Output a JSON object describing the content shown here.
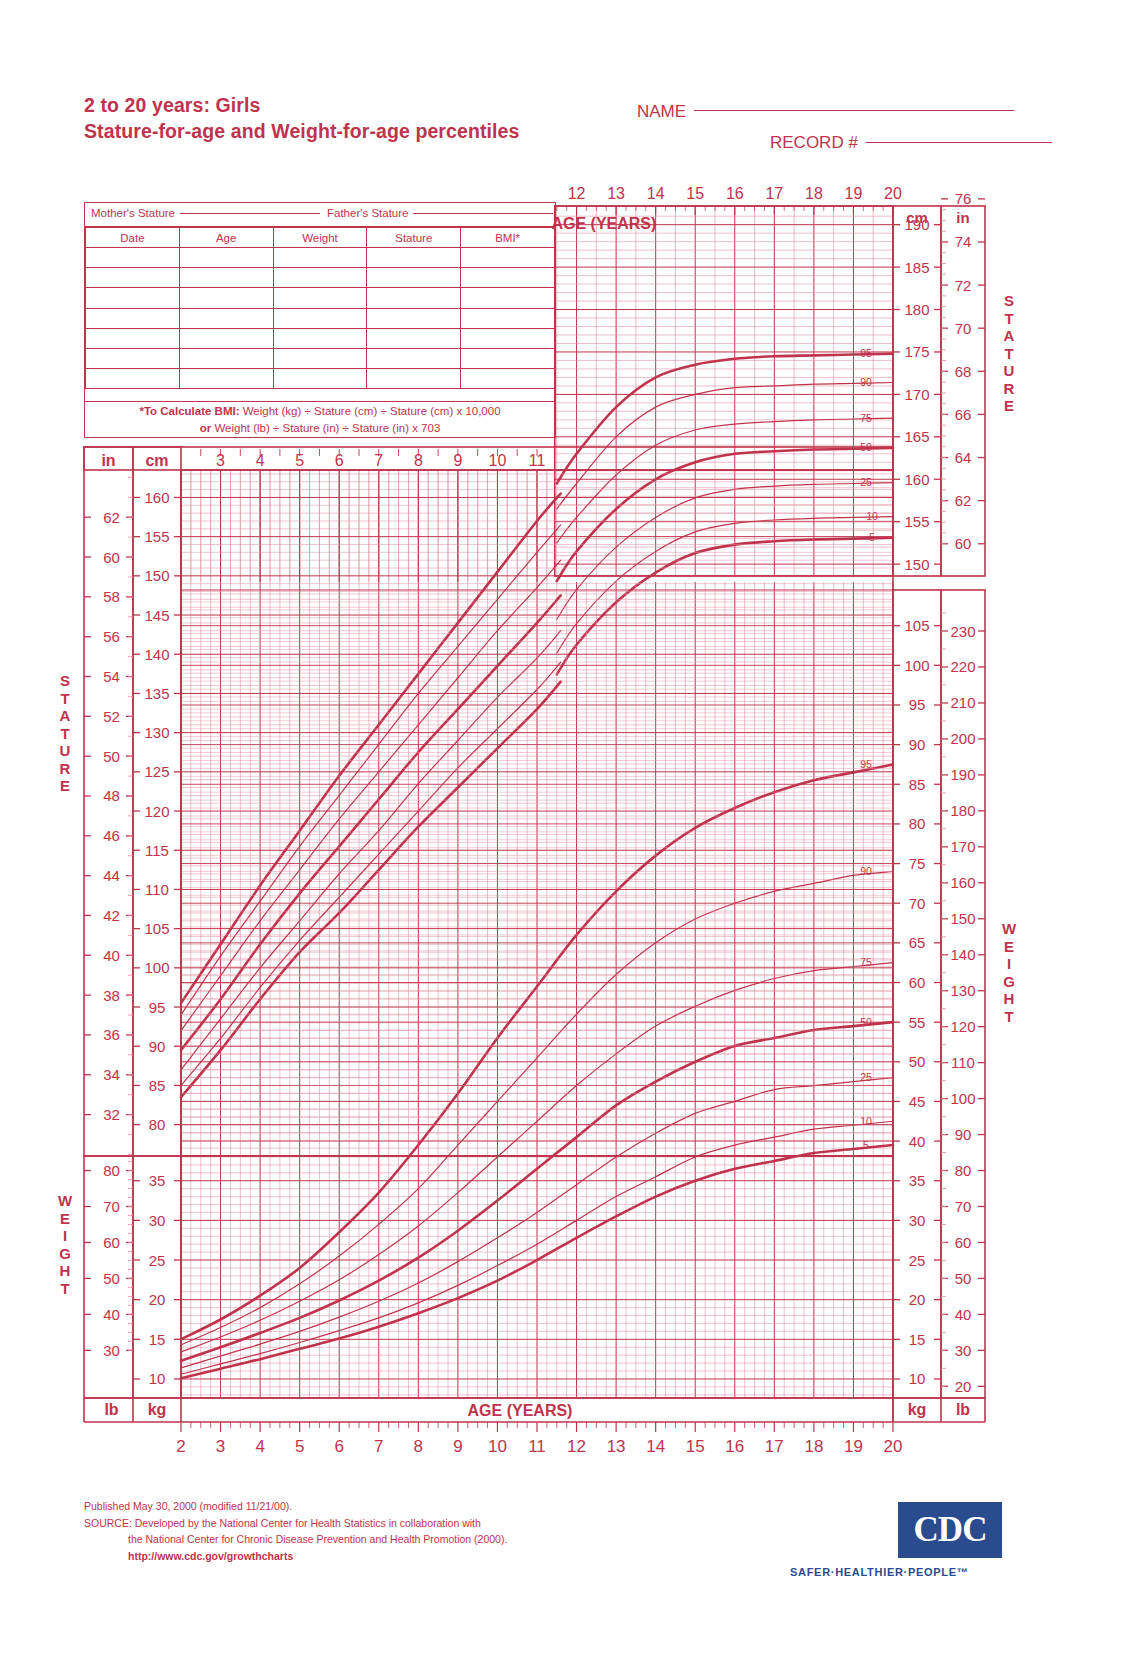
{
  "header": {
    "title_line1": "2 to 20 years: Girls",
    "title_line2": "Stature-for-age and Weight-for-age percentiles",
    "name_label": "NAME",
    "record_label": "RECORD #"
  },
  "table": {
    "mother_label": "Mother's Stature",
    "father_label": "Father's Stature",
    "columns": [
      "Date",
      "Age",
      "Weight",
      "Stature",
      "BMI*"
    ],
    "rows": [
      [
        "",
        "",
        "",
        "",
        ""
      ],
      [
        "",
        "",
        "",
        "",
        ""
      ],
      [
        "",
        "",
        "",
        "",
        ""
      ],
      [
        "",
        "",
        "",
        "",
        ""
      ],
      [
        "",
        "",
        "",
        "",
        ""
      ],
      [
        "",
        "",
        "",
        "",
        ""
      ],
      [
        "",
        "",
        "",
        "",
        ""
      ]
    ],
    "bmi_note_prefix": "*To Calculate BMI:",
    "bmi_note_line1": " Weight (kg) ÷ Stature (cm) ÷ Stature (cm) x 10,000",
    "bmi_note_or": "or",
    "bmi_note_line2": " Weight (lb) ÷ Stature (in) ÷ Stature (in) x 703"
  },
  "labels": {
    "age_years_top": "AGE (YEARS)",
    "age_years_bottom": "AGE (YEARS)",
    "stature_word": "STATURE",
    "weight_word": "WEIGHT",
    "cm": "cm",
    "in": "in",
    "kg": "kg",
    "lb": "lb"
  },
  "footer": {
    "published": "Published May 30, 2000 (modified 11/21/00).",
    "source1": "SOURCE: Developed by the National Center for Health Statistics in collaboration with",
    "source2": "the National Center for Chronic Disease Prevention and Health Promotion (2000).",
    "url": "http://www.cdc.gov/growthcharts",
    "cdc_logo": "CDC",
    "cdc_tagline": "SAFER·HEALTHIER·PEOPLE™"
  },
  "colors": {
    "chart_red": "#c0334d",
    "grid_light": "#e08a9b",
    "cdc_blue": "#2a4b8d"
  },
  "chart_data": {
    "type": "line",
    "xlabel": "AGE (YEARS)",
    "xlim": [
      2,
      20
    ],
    "x_ticks_bottom": [
      2,
      3,
      4,
      5,
      6,
      7,
      8,
      9,
      10,
      11,
      12,
      13,
      14,
      15,
      16,
      17,
      18,
      19,
      20
    ],
    "x_ticks_top_upper": [
      12,
      13,
      14,
      15,
      16,
      17,
      18,
      19,
      20
    ],
    "x_ticks_mid": [
      3,
      4,
      5,
      6,
      7,
      8,
      9,
      10,
      11
    ],
    "panels": [
      {
        "name": "stature-upper-right",
        "ylabel": "STATURE",
        "y_unit_left": "cm",
        "y_unit_right": "in",
        "ylim_cm": [
          150,
          192
        ],
        "y_ticks_cm": [
          150,
          155,
          160,
          165,
          170,
          175,
          180,
          185,
          190
        ],
        "y_ticks_in": [
          60,
          62,
          64,
          66,
          68,
          70,
          72,
          74,
          76
        ],
        "xlim": [
          11.5,
          20
        ],
        "percentile_labels": [
          "95",
          "90",
          "75",
          "50",
          "25",
          "10",
          "5"
        ]
      },
      {
        "name": "stature-main",
        "ylabel": "STATURE",
        "y_unit_left": "in",
        "y_unit_right": "cm",
        "ylim_cm": [
          76,
          163
        ],
        "y_ticks_in": [
          30,
          32,
          34,
          36,
          38,
          40,
          42,
          44,
          46,
          48,
          50,
          52,
          54,
          56,
          58,
          60,
          62
        ],
        "y_ticks_cm": [
          80,
          85,
          90,
          95,
          100,
          105,
          110,
          115,
          120,
          125,
          130,
          135,
          140,
          145,
          150,
          155,
          160
        ],
        "xlim": [
          2,
          11.6
        ],
        "percentile_labels": [
          "95",
          "90",
          "75",
          "50",
          "25",
          "10",
          "5"
        ],
        "series": [
          {
            "name": "95th",
            "unit": "cm",
            "x": [
              2,
              3,
              4,
              5,
              6,
              7,
              8,
              9,
              10,
              11,
              11.6
            ],
            "y": [
              95.5,
              103.0,
              110.5,
              117.5,
              124.5,
              131.0,
              137.5,
              144.0,
              150.5,
              157.0,
              160.5
            ]
          },
          {
            "name": "90th",
            "unit": "cm",
            "x": [
              2,
              3,
              4,
              5,
              6,
              7,
              8,
              9,
              10,
              11,
              11.6
            ],
            "y": [
              94.0,
              101.5,
              108.5,
              115.5,
              122.0,
              128.5,
              135.0,
              141.0,
              147.0,
              153.0,
              156.5
            ]
          },
          {
            "name": "75th",
            "unit": "cm",
            "x": [
              2,
              3,
              4,
              5,
              6,
              7,
              8,
              9,
              10,
              11,
              11.6
            ],
            "y": [
              92.0,
              99.0,
              106.0,
              112.5,
              119.0,
              125.0,
              131.0,
              137.0,
              143.0,
              148.5,
              152.0
            ]
          },
          {
            "name": "50th",
            "unit": "cm",
            "x": [
              2,
              3,
              4,
              5,
              6,
              7,
              8,
              9,
              10,
              11,
              11.6
            ],
            "y": [
              89.5,
              96.0,
              103.0,
              109.5,
              115.5,
              121.5,
              127.5,
              133.0,
              138.5,
              144.0,
              147.5
            ]
          },
          {
            "name": "25th",
            "unit": "cm",
            "x": [
              2,
              3,
              4,
              5,
              6,
              7,
              8,
              9,
              10,
              11,
              11.6
            ],
            "y": [
              87.0,
              93.5,
              100.0,
              106.0,
              112.0,
              117.5,
              123.5,
              129.0,
              134.5,
              139.5,
              143.0
            ]
          },
          {
            "name": "10th",
            "unit": "cm",
            "x": [
              2,
              3,
              4,
              5,
              6,
              7,
              8,
              9,
              10,
              11,
              11.6
            ],
            "y": [
              85.0,
              91.0,
              97.5,
              103.5,
              109.0,
              114.5,
              120.0,
              125.5,
              130.5,
              135.5,
              139.0
            ]
          },
          {
            "name": "5th",
            "unit": "cm",
            "x": [
              2,
              3,
              4,
              5,
              6,
              7,
              8,
              9,
              10,
              11,
              11.6
            ],
            "y": [
              83.5,
              89.5,
              96.0,
              102.0,
              107.0,
              112.5,
              118.0,
              123.0,
              128.0,
              133.0,
              136.5
            ]
          }
        ]
      },
      {
        "name": "weight-right",
        "ylabel": "WEIGHT",
        "y_unit_left": "kg",
        "y_unit_right": "lb",
        "ylim_kg": [
          8,
          108
        ],
        "y_ticks_kg": [
          10,
          15,
          20,
          25,
          30,
          35,
          40,
          45,
          50,
          55,
          60,
          65,
          70,
          75,
          80,
          85,
          90,
          95,
          100,
          105
        ],
        "y_ticks_lb": [
          20,
          30,
          40,
          50,
          60,
          70,
          80,
          90,
          100,
          110,
          120,
          130,
          140,
          150,
          160,
          170,
          180,
          190,
          200,
          210,
          220,
          230
        ],
        "percentile_labels": [
          "95",
          "90",
          "75",
          "50",
          "25",
          "10",
          "5"
        ]
      },
      {
        "name": "weight-lower-left",
        "ylabel": "WEIGHT",
        "y_unit_left": "lb",
        "y_unit_right": "kg",
        "y_ticks_lb": [
          30,
          40,
          50,
          60,
          70,
          80
        ],
        "y_ticks_kg": [
          10,
          15,
          20,
          25,
          30,
          35
        ]
      }
    ],
    "weight_series": [
      {
        "name": "95th",
        "unit": "kg",
        "x": [
          2,
          3,
          4,
          5,
          6,
          7,
          8,
          9,
          10,
          11,
          12,
          13,
          14,
          15,
          16,
          17,
          18,
          19,
          20
        ],
        "y": [
          15.0,
          17.5,
          20.5,
          24.0,
          28.5,
          33.5,
          39.5,
          46.0,
          53.0,
          59.5,
          66.0,
          71.5,
          76.0,
          79.5,
          82.0,
          84.0,
          85.5,
          86.5,
          87.5
        ]
      },
      {
        "name": "90th",
        "unit": "kg",
        "x": [
          2,
          3,
          4,
          5,
          6,
          7,
          8,
          9,
          10,
          11,
          12,
          13,
          14,
          15,
          16,
          17,
          18,
          19,
          20
        ],
        "y": [
          14.3,
          16.5,
          19.0,
          22.0,
          25.5,
          29.5,
          34.0,
          39.5,
          45.0,
          50.5,
          56.0,
          61.0,
          65.0,
          68.0,
          70.0,
          71.5,
          72.5,
          73.5,
          74.0
        ]
      },
      {
        "name": "75th",
        "unit": "kg",
        "x": [
          2,
          3,
          4,
          5,
          6,
          7,
          8,
          9,
          10,
          11,
          12,
          13,
          14,
          15,
          16,
          17,
          18,
          19,
          20
        ],
        "y": [
          13.4,
          15.3,
          17.4,
          19.8,
          22.5,
          25.7,
          29.3,
          33.5,
          38.0,
          42.5,
          47.0,
          51.0,
          54.5,
          57.0,
          59.0,
          60.5,
          61.5,
          62.0,
          62.5
        ]
      },
      {
        "name": "50th",
        "unit": "kg",
        "x": [
          2,
          3,
          4,
          5,
          6,
          7,
          8,
          9,
          10,
          11,
          12,
          13,
          14,
          15,
          16,
          17,
          18,
          19,
          20
        ],
        "y": [
          12.3,
          14.0,
          15.8,
          17.7,
          19.9,
          22.4,
          25.3,
          28.7,
          32.5,
          36.5,
          40.5,
          44.5,
          47.5,
          50.0,
          52.0,
          53.0,
          54.0,
          54.5,
          55.0
        ]
      },
      {
        "name": "25th",
        "unit": "kg",
        "x": [
          2,
          3,
          4,
          5,
          6,
          7,
          8,
          9,
          10,
          11,
          12,
          13,
          14,
          15,
          16,
          17,
          18,
          19,
          20
        ],
        "y": [
          11.4,
          12.9,
          14.4,
          16.0,
          17.8,
          19.8,
          22.1,
          24.8,
          27.8,
          31.0,
          34.5,
          38.0,
          41.0,
          43.5,
          45.0,
          46.5,
          47.0,
          47.5,
          48.0
        ]
      },
      {
        "name": "10th",
        "unit": "kg",
        "x": [
          2,
          3,
          4,
          5,
          6,
          7,
          8,
          9,
          10,
          11,
          12,
          13,
          14,
          15,
          16,
          17,
          18,
          19,
          20
        ],
        "y": [
          10.6,
          11.9,
          13.2,
          14.6,
          16.1,
          17.7,
          19.6,
          21.8,
          24.3,
          27.0,
          30.0,
          33.0,
          35.5,
          38.0,
          39.5,
          40.5,
          41.5,
          42.0,
          42.5
        ]
      },
      {
        "name": "5th",
        "unit": "kg",
        "x": [
          2,
          3,
          4,
          5,
          6,
          7,
          8,
          9,
          10,
          11,
          12,
          13,
          14,
          15,
          16,
          17,
          18,
          19,
          20
        ],
        "y": [
          10.1,
          11.3,
          12.5,
          13.8,
          15.1,
          16.6,
          18.3,
          20.2,
          22.4,
          25.0,
          27.8,
          30.5,
          33.0,
          35.0,
          36.5,
          37.5,
          38.5,
          39.0,
          39.5
        ]
      }
    ],
    "stature_upper_series": [
      {
        "name": "95th",
        "unit": "cm",
        "x": [
          11.5,
          12,
          13,
          14,
          15,
          16,
          17,
          18,
          19,
          20
        ],
        "y": [
          159.5,
          163.0,
          168.5,
          172.0,
          173.5,
          174.2,
          174.5,
          174.6,
          174.7,
          174.8
        ]
      },
      {
        "name": "90th",
        "unit": "cm",
        "x": [
          11.5,
          12,
          13,
          14,
          15,
          16,
          17,
          18,
          19,
          20
        ],
        "y": [
          156.5,
          159.5,
          165.0,
          168.5,
          170.0,
          170.8,
          171.0,
          171.2,
          171.3,
          171.4
        ]
      },
      {
        "name": "75th",
        "unit": "cm",
        "x": [
          11.5,
          12,
          13,
          14,
          15,
          16,
          17,
          18,
          19,
          20
        ],
        "y": [
          152.5,
          155.5,
          160.5,
          164.0,
          165.8,
          166.5,
          166.8,
          167.0,
          167.1,
          167.2
        ]
      },
      {
        "name": "50th",
        "unit": "cm",
        "x": [
          11.5,
          12,
          13,
          14,
          15,
          16,
          17,
          18,
          19,
          20
        ],
        "y": [
          148.0,
          151.5,
          156.5,
          160.0,
          162.0,
          163.0,
          163.3,
          163.5,
          163.6,
          163.7
        ]
      },
      {
        "name": "25th",
        "unit": "cm",
        "x": [
          11.5,
          12,
          13,
          14,
          15,
          16,
          17,
          18,
          19,
          20
        ],
        "y": [
          143.5,
          147.0,
          152.0,
          155.5,
          157.8,
          158.8,
          159.2,
          159.4,
          159.5,
          159.6
        ]
      },
      {
        "name": "10th",
        "unit": "cm",
        "x": [
          11.5,
          12,
          13,
          14,
          15,
          16,
          17,
          18,
          19,
          20
        ],
        "y": [
          139.5,
          143.0,
          148.0,
          151.5,
          153.8,
          154.8,
          155.2,
          155.4,
          155.5,
          155.6
        ]
      },
      {
        "name": "5th",
        "unit": "cm",
        "x": [
          11.5,
          12,
          13,
          14,
          15,
          16,
          17,
          18,
          19,
          20
        ],
        "y": [
          137.0,
          140.5,
          145.5,
          149.0,
          151.3,
          152.3,
          152.7,
          152.9,
          153.0,
          153.1
        ]
      }
    ]
  }
}
